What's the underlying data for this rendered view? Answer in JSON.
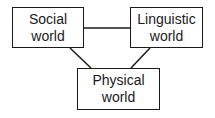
{
  "diagram": {
    "nodes": [
      {
        "id": "social",
        "line1": "Social",
        "line2": "world"
      },
      {
        "id": "linguistic",
        "line1": "Linguistic",
        "line2": "world"
      },
      {
        "id": "physical",
        "line1": "Physical",
        "line2": "world"
      }
    ],
    "edges": [
      {
        "from": "social",
        "to": "linguistic"
      },
      {
        "from": "social",
        "to": "physical"
      },
      {
        "from": "linguistic",
        "to": "physical"
      }
    ],
    "colors": {
      "stroke": "#1a1a1a",
      "background": "#ffffff"
    }
  }
}
